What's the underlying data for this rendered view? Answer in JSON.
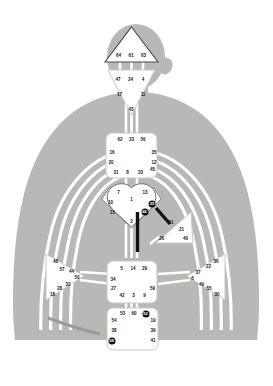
{
  "diagram": {
    "silhouette_color": "#b8b8b8",
    "center_fill": "#ffffff",
    "center_stroke": "#8a8a8a",
    "channel_color": "#ffffff",
    "activated_color": "#111111",
    "gate_text_color": "#1a1a1a"
  },
  "centers": [
    {
      "name": "head",
      "shape": "triangle-up",
      "gates": [
        {
          "num": "64",
          "x": 118.5,
          "y": 55.5,
          "active": false
        },
        {
          "num": "61",
          "x": 131.0,
          "y": 55.5,
          "active": false
        },
        {
          "num": "63",
          "x": 143.5,
          "y": 55.5,
          "active": false
        }
      ]
    },
    {
      "name": "ajna",
      "shape": "triangle-down",
      "gates": [
        {
          "num": "47",
          "x": 118.0,
          "y": 79.5,
          "active": false
        },
        {
          "num": "24",
          "x": 130.5,
          "y": 79.5,
          "active": false
        },
        {
          "num": "4",
          "x": 143.0,
          "y": 79.5,
          "active": false
        },
        {
          "num": "17",
          "x": 119.5,
          "y": 95.0,
          "active": false
        },
        {
          "num": "11",
          "x": 143.0,
          "y": 95.0,
          "active": false
        },
        {
          "num": "43",
          "x": 131.0,
          "y": 110.0,
          "active": false
        }
      ]
    },
    {
      "name": "throat",
      "shape": "square",
      "gates": [
        {
          "num": "62",
          "x": 120.0,
          "y": 140.0,
          "active": false
        },
        {
          "num": "23",
          "x": 131.5,
          "y": 140.0,
          "active": false
        },
        {
          "num": "56",
          "x": 143.0,
          "y": 140.0,
          "active": false
        },
        {
          "num": "16",
          "x": 112.0,
          "y": 152.5,
          "active": false
        },
        {
          "num": "35",
          "x": 154.0,
          "y": 152.5,
          "active": false
        },
        {
          "num": "20",
          "x": 111.0,
          "y": 163.0,
          "active": false
        },
        {
          "num": "12",
          "x": 154.0,
          "y": 163.0,
          "active": false
        },
        {
          "num": "31",
          "x": 116.0,
          "y": 172.5,
          "active": false
        },
        {
          "num": "8",
          "x": 127.5,
          "y": 172.5,
          "active": false
        },
        {
          "num": "33",
          "x": 140.5,
          "y": 172.5,
          "active": false
        },
        {
          "num": "45",
          "x": 152.5,
          "y": 169.5,
          "active": false
        }
      ]
    },
    {
      "name": "g-center",
      "shape": "diamond",
      "gates": [
        {
          "num": "7",
          "x": 118.5,
          "y": 193.0,
          "active": false
        },
        {
          "num": "13",
          "x": 145.0,
          "y": 193.0,
          "active": false
        },
        {
          "num": "1",
          "x": 131.5,
          "y": 200.0,
          "active": false
        },
        {
          "num": "10",
          "x": 110.5,
          "y": 202.5,
          "active": false
        },
        {
          "num": "25",
          "x": 152.0,
          "y": 203.5,
          "active": true
        },
        {
          "num": "15",
          "x": 112.5,
          "y": 212.5,
          "active": false
        },
        {
          "num": "46",
          "x": 144.5,
          "y": 212.0,
          "active": true
        },
        {
          "num": "2",
          "x": 131.5,
          "y": 222.0,
          "active": false
        }
      ]
    },
    {
      "name": "heart",
      "shape": "triangle-left",
      "gates": [
        {
          "num": "51",
          "x": 171.0,
          "y": 223.0,
          "active": false
        },
        {
          "num": "21",
          "x": 181.5,
          "y": 229.5,
          "active": false
        },
        {
          "num": "26",
          "x": 161.5,
          "y": 238.5,
          "active": false
        },
        {
          "num": "40",
          "x": 185.5,
          "y": 238.5,
          "active": false
        }
      ]
    },
    {
      "name": "spleen",
      "shape": "triangle-right",
      "gates": [
        {
          "num": "48",
          "x": 55.5,
          "y": 261.5,
          "active": false
        },
        {
          "num": "57",
          "x": 62.0,
          "y": 269.5,
          "active": false
        },
        {
          "num": "44",
          "x": 71.5,
          "y": 272.0,
          "active": false
        },
        {
          "num": "50",
          "x": 77.0,
          "y": 278.0,
          "active": false
        },
        {
          "num": "32",
          "x": 68.0,
          "y": 284.5,
          "active": false
        },
        {
          "num": "28",
          "x": 59.5,
          "y": 288.5,
          "active": false
        },
        {
          "num": "18",
          "x": 52.5,
          "y": 294.5,
          "active": false
        }
      ]
    },
    {
      "name": "solar-plexus",
      "shape": "triangle-left",
      "gates": [
        {
          "num": "36",
          "x": 216.0,
          "y": 261.5,
          "active": false
        },
        {
          "num": "22",
          "x": 208.5,
          "y": 267.0,
          "active": false
        },
        {
          "num": "37",
          "x": 198.0,
          "y": 272.5,
          "active": false
        },
        {
          "num": "6",
          "x": 192.5,
          "y": 279.0,
          "active": false
        },
        {
          "num": "49",
          "x": 201.5,
          "y": 284.5,
          "active": false
        },
        {
          "num": "55",
          "x": 209.0,
          "y": 288.5,
          "active": false
        },
        {
          "num": "30",
          "x": 217.0,
          "y": 294.5,
          "active": false
        }
      ]
    },
    {
      "name": "sacral",
      "shape": "square",
      "gates": [
        {
          "num": "5",
          "x": 121.5,
          "y": 268.5,
          "active": false
        },
        {
          "num": "14",
          "x": 133.0,
          "y": 268.5,
          "active": false
        },
        {
          "num": "29",
          "x": 144.5,
          "y": 268.5,
          "active": false
        },
        {
          "num": "34",
          "x": 113.0,
          "y": 279.5,
          "active": false
        },
        {
          "num": "27",
          "x": 113.5,
          "y": 288.5,
          "active": false
        },
        {
          "num": "59",
          "x": 152.5,
          "y": 288.5,
          "active": false
        },
        {
          "num": "42",
          "x": 122.0,
          "y": 296.0,
          "active": false
        },
        {
          "num": "3",
          "x": 133.5,
          "y": 296.0,
          "active": false
        },
        {
          "num": "9",
          "x": 144.5,
          "y": 296.0,
          "active": false
        }
      ]
    },
    {
      "name": "root",
      "shape": "square",
      "gates": [
        {
          "num": "53",
          "x": 122.5,
          "y": 314.0,
          "active": false
        },
        {
          "num": "60",
          "x": 134.0,
          "y": 314.0,
          "active": false
        },
        {
          "num": "52",
          "x": 145.5,
          "y": 313.5,
          "active": true
        },
        {
          "num": "54",
          "x": 114.0,
          "y": 320.5,
          "active": false
        },
        {
          "num": "19",
          "x": 153.0,
          "y": 320.5,
          "active": false
        },
        {
          "num": "38",
          "x": 114.0,
          "y": 330.5,
          "active": false
        },
        {
          "num": "39",
          "x": 153.0,
          "y": 330.5,
          "active": false
        },
        {
          "num": "58",
          "x": 111.5,
          "y": 341.0,
          "active": true
        },
        {
          "num": "41",
          "x": 153.0,
          "y": 341.0,
          "active": false
        }
      ]
    }
  ]
}
